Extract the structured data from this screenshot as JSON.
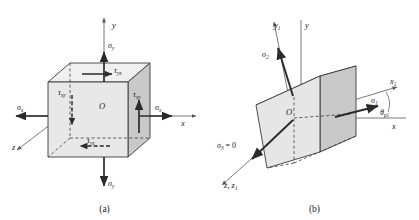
{
  "figure": {
    "background_color": "#ffffff",
    "line_color": "#3a3a3a",
    "arrow_color": "#2b2b2b",
    "face_front_color": "#e8e8e8",
    "face_side_color": "#c9c9c9",
    "face_top_color": "#f0f0f0"
  },
  "panels": [
    {
      "id": "a",
      "caption": "(a)",
      "description": "Stress element aligned with x, y, z axes showing normal and shear stresses",
      "axes": [
        {
          "name": "y-axis",
          "label": "y",
          "sub": "",
          "direction": "up"
        },
        {
          "name": "x-axis",
          "label": "x",
          "sub": "",
          "direction": "right"
        },
        {
          "name": "z-axis",
          "label": "z",
          "sub": "",
          "direction": "lower-left"
        }
      ],
      "origin_label": "O",
      "stress_labels": [
        {
          "name": "sigma-y-top",
          "symbol": "σ",
          "sub": "y",
          "pos": "top"
        },
        {
          "name": "sigma-y-bottom",
          "symbol": "σ",
          "sub": "y",
          "pos": "bottom"
        },
        {
          "name": "sigma-x-left",
          "symbol": "σ",
          "sub": "x",
          "pos": "left"
        },
        {
          "name": "sigma-x-right",
          "symbol": "σ",
          "sub": "x",
          "pos": "right"
        },
        {
          "name": "tau-yx-top",
          "symbol": "τ",
          "sub": "yx",
          "pos": "top-face"
        },
        {
          "name": "tau-yx-bottom",
          "symbol": "τ",
          "sub": "yx",
          "pos": "bottom-face"
        },
        {
          "name": "tau-xy-left",
          "symbol": "τ",
          "sub": "xy",
          "pos": "left-face"
        },
        {
          "name": "tau-xy-right",
          "symbol": "τ",
          "sub": "xy",
          "pos": "right-face"
        }
      ]
    },
    {
      "id": "b",
      "caption": "(b)",
      "description": "Rotated stress element aligned with principal axes x1, y1, z1",
      "axes": [
        {
          "name": "y-axis",
          "label": "y",
          "sub": "",
          "direction": "up"
        },
        {
          "name": "y1-axis",
          "label": "y",
          "sub": "1",
          "direction": "up-left-tilt"
        },
        {
          "name": "x-axis",
          "label": "x",
          "sub": "",
          "direction": "right"
        },
        {
          "name": "x1-axis",
          "label": "x",
          "sub": "1",
          "direction": "right-up-tilt"
        },
        {
          "name": "z-z1-axis",
          "label": "z, z",
          "sub": "1",
          "direction": "lower-left"
        }
      ],
      "origin_label": "O",
      "angle_label": {
        "name": "theta-p1",
        "symbol": "θ",
        "sub": "p1"
      },
      "stress_labels": [
        {
          "name": "sigma-1",
          "symbol": "σ",
          "sub": "1",
          "value": "",
          "pos": "right"
        },
        {
          "name": "sigma-2",
          "symbol": "σ",
          "sub": "2",
          "value": "",
          "pos": "upper-left"
        },
        {
          "name": "sigma-3",
          "symbol": "σ",
          "sub": "3",
          "value": " = 0",
          "pos": "lower-left"
        }
      ]
    }
  ]
}
